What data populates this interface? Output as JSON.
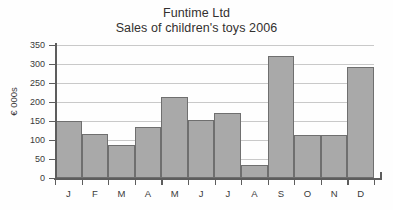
{
  "chart_data": {
    "type": "bar",
    "title": "Funtime Ltd",
    "subtitle": "Sales of children's toys 2006",
    "title_lines": [
      "Funtime Ltd",
      "Sales of children's toys 2006"
    ],
    "categories": [
      "J",
      "F",
      "M",
      "A",
      "M",
      "J",
      "J",
      "A",
      "S",
      "O",
      "N",
      "D"
    ],
    "values": [
      150,
      117,
      87,
      135,
      213,
      153,
      172,
      34,
      322,
      113,
      113,
      292
    ],
    "series": [
      {
        "name": "Sales",
        "values": [
          150,
          117,
          87,
          135,
          213,
          153,
          172,
          34,
          322,
          113,
          113,
          292
        ]
      }
    ],
    "xlabel": "",
    "ylabel": "€ 000s",
    "ylim": [
      0,
      350
    ],
    "ytick_step": 50,
    "yticks": [
      0,
      50,
      100,
      150,
      200,
      250,
      300,
      350
    ],
    "ytick_labels": [
      "0",
      "50",
      "100",
      "150",
      "200",
      "250",
      "300",
      "350"
    ],
    "grid": true,
    "legend": false,
    "bar_color": "#a9a9a9",
    "bar_border_color": "#6f6f6f",
    "gridline_color": "#c9c9c9",
    "axis_color": "#5d5d5d"
  }
}
